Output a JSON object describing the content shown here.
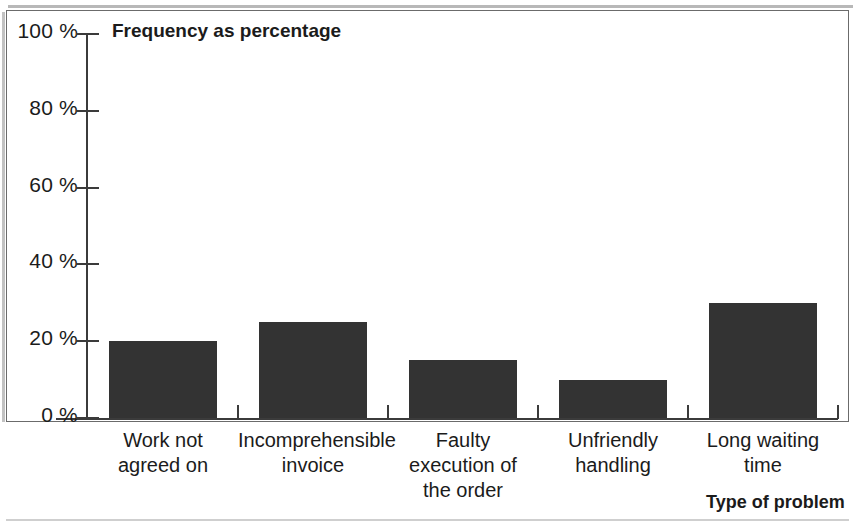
{
  "chart_data": {
    "type": "bar",
    "title": "Frequency as percentage",
    "ylabel": "Frequency as percentage",
    "xlabel": "Type of problem",
    "categories": [
      "Work not agreed on",
      "Incomprehensible invoice",
      "Faulty execution of the order",
      "Unfriendly handling",
      "Long waiting time"
    ],
    "category_lines": [
      [
        "Work not",
        "agreed on"
      ],
      [
        "Incomprehensible",
        "invoice"
      ],
      [
        "Faulty",
        "execution of",
        "the order"
      ],
      [
        "Unfriendly",
        "handling"
      ],
      [
        "Long waiting",
        "time"
      ]
    ],
    "values": [
      20,
      25,
      15,
      10,
      30
    ],
    "value_labels": [
      "20 %",
      "25 %",
      "15 %",
      "10 %",
      "30 %"
    ],
    "ylim": [
      0,
      100
    ],
    "ytick_values": [
      0,
      20,
      40,
      60,
      80,
      100
    ],
    "ytick_labels": [
      "0 %",
      "20 %",
      "40 %",
      "60 %",
      "80 %",
      "100 %"
    ],
    "grid": false,
    "legend": null,
    "bar_color": "#333333",
    "axis_color": "#3b3b3b",
    "frame_color": "#6b6b6b",
    "background_color": "#ffffff"
  },
  "figure": {
    "y_caption": "Frequency as percentage",
    "x_caption": "Type of problem"
  }
}
